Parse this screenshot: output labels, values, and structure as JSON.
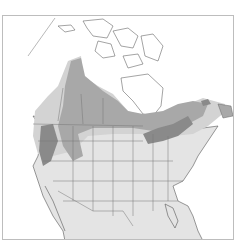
{
  "map": {
    "region": "North America",
    "colors": {
      "background": "#ffffff",
      "frame": "#bdbdbd",
      "land": "#ffffff",
      "nonbreeding": "#e4e4e4",
      "migration": "#d3d3d3",
      "breeding": "#a8a8a8",
      "year_round": "#8a8a8a",
      "borders": "#777777",
      "coast": "#555555"
    },
    "legend": []
  }
}
